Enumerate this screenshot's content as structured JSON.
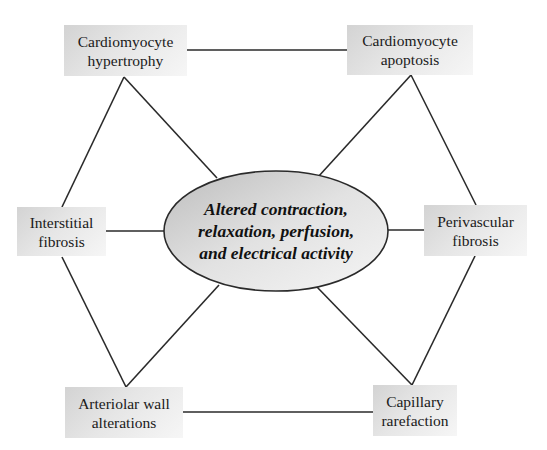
{
  "diagram": {
    "center": {
      "lines": [
        "Altered contraction,",
        "relaxation, perfusion,",
        "and electrical activity"
      ]
    },
    "nodes": {
      "top_left": {
        "lines": [
          "Cardiomyocyte",
          "hypertrophy"
        ]
      },
      "top_right": {
        "lines": [
          "Cardiomyocyte",
          "apoptosis"
        ]
      },
      "mid_left": {
        "lines": [
          "Interstitial",
          "fibrosis"
        ]
      },
      "mid_right": {
        "lines": [
          "Perivascular",
          "fibrosis"
        ]
      },
      "bottom_left": {
        "lines": [
          "Arteriolar wall",
          "alterations"
        ]
      },
      "bottom_right": {
        "lines": [
          "Capillary",
          "rarefaction"
        ]
      }
    },
    "colors": {
      "line": "#2a2a2a",
      "box_dark": "#d3d3d3",
      "box_light": "#f6f6f6",
      "ellipse_dark": "#c8c8c8",
      "ellipse_light": "#f4f4f4"
    }
  }
}
